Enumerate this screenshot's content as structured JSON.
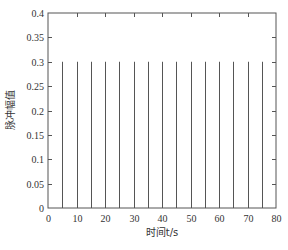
{
  "chart_data": {
    "type": "bar",
    "subtype": "stem/pulse",
    "title": "",
    "xlabel": "时间t/s",
    "ylabel": "脉冲幅值",
    "xlim": [
      0,
      80
    ],
    "ylim": [
      0,
      0.4
    ],
    "xticks": [
      0,
      10,
      20,
      30,
      40,
      50,
      60,
      70,
      80
    ],
    "xtick_labels": [
      "0",
      "10",
      "20",
      "30",
      "40",
      "50",
      "60",
      "70",
      "80"
    ],
    "yticks": [
      0,
      0.05,
      0.1,
      0.15,
      0.2,
      0.25,
      0.3,
      0.35,
      0.4
    ],
    "ytick_labels": [
      "0",
      "0.05",
      "0.1",
      "0.15",
      "0.2",
      "0.25",
      "0.3",
      "0.35",
      "0.4"
    ],
    "grid": false,
    "legend": null,
    "series": [
      {
        "name": "脉冲",
        "x": [
          5,
          10,
          15,
          20,
          25,
          30,
          35,
          40,
          45,
          50,
          55,
          60,
          65,
          70,
          75
        ],
        "values": [
          0.3,
          0.3,
          0.3,
          0.3,
          0.3,
          0.3,
          0.3,
          0.3,
          0.3,
          0.3,
          0.3,
          0.3,
          0.3,
          0.3,
          0.3
        ]
      }
    ]
  },
  "style": {
    "line_color": "#555555",
    "axis_color": "#555555",
    "background": "#ffffff"
  }
}
